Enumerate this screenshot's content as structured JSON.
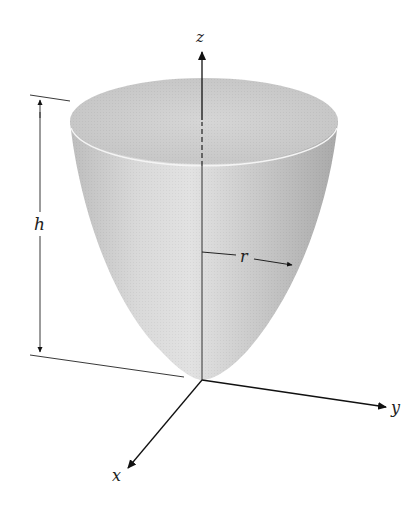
{
  "figure": {
    "labels": {
      "z_axis": "z",
      "y_axis": "y",
      "x_axis": "x",
      "height": "h",
      "radius": "r"
    },
    "colors": {
      "surface_light": "#e4e4e4",
      "surface_mid": "#c8c8c8",
      "surface_dark": "#a8a8a8",
      "top_cap": "#d2d2d2",
      "lines": "#222222"
    }
  }
}
